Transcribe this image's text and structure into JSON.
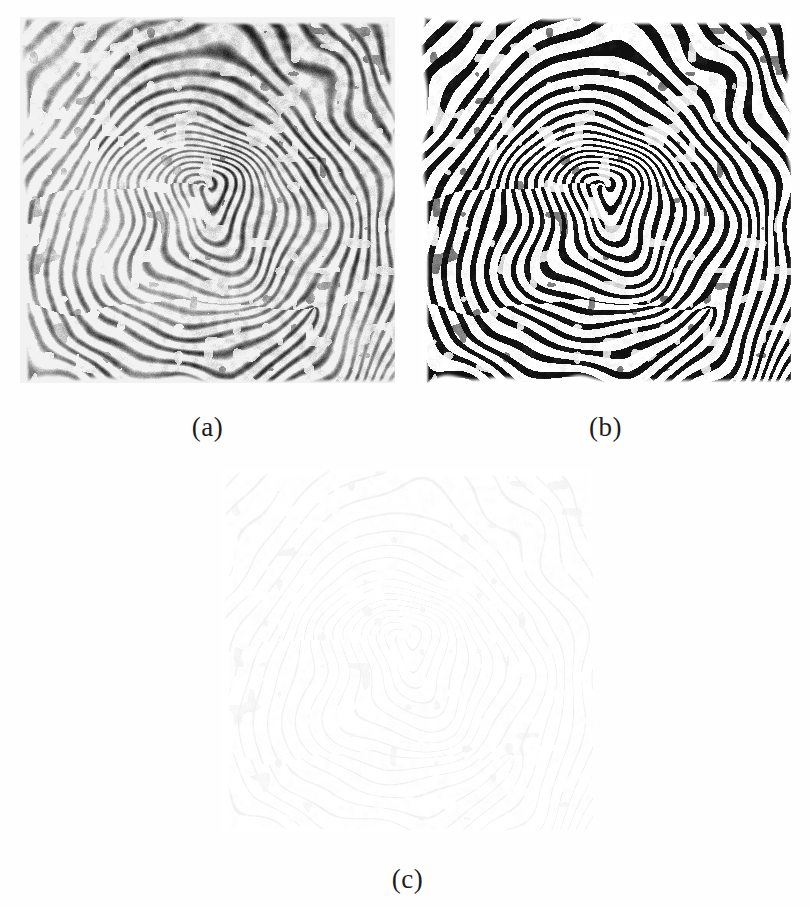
{
  "figure": {
    "type": "multi-panel-image-figure",
    "background_color": "#fefefe",
    "panel_count": 3,
    "panels": [
      {
        "id": "a",
        "caption": "(a)",
        "content": "fingerprint-enhanced-grayscale",
        "description": "Enhanced grayscale fingerprint image with loop ridge pattern",
        "x": 20,
        "y": 17,
        "width": 375,
        "height": 366,
        "render": {
          "style": "grayscale",
          "ink_color": "#1e1e1e",
          "paper_color": "#f2f2f2",
          "ridge_period": 8.6,
          "line_width": 3.4,
          "blur": 0.9,
          "contrast": 0.82,
          "noise": 0.28,
          "vignette": 0.35
        }
      },
      {
        "id": "b",
        "caption": "(b)",
        "content": "fingerprint-binarized",
        "description": "Binarized (black and white) fingerprint image of the same impression",
        "x": 420,
        "y": 17,
        "width": 371,
        "height": 366,
        "render": {
          "style": "binary",
          "ink_color": "#101010",
          "paper_color": "#ffffff",
          "ridge_period": 8.6,
          "line_width": 3.9,
          "blur": 0.2,
          "contrast": 1.0,
          "noise": 0.16,
          "vignette": 0.0
        }
      },
      {
        "id": "c",
        "caption": "(c)",
        "content": "fingerprint-thinned-skeleton",
        "description": "Thinned skeleton of the binarized fingerprint, single pixel wide ridges",
        "x": 222,
        "y": 470,
        "width": 371,
        "height": 362,
        "render": {
          "style": "skeleton",
          "ink_color": "#b9b9b9",
          "paper_color": "#ffffff",
          "ridge_period": 8.6,
          "line_width": 1.0,
          "blur": 0.0,
          "contrast": 0.22,
          "noise": 0.1,
          "vignette": 0.0
        }
      }
    ],
    "caption_font_size_px": 27,
    "caption_color": "#1c1c1e"
  },
  "fingerprint_model": {
    "pattern_type": "loop",
    "core": {
      "x": 0.505,
      "y": 0.47
    },
    "delta": {
      "x": 0.8,
      "y": 0.79
    },
    "ridge_count_approx": 44,
    "orientation_note": "ridges flow as concentric loop around core, flattening toward lower border"
  }
}
